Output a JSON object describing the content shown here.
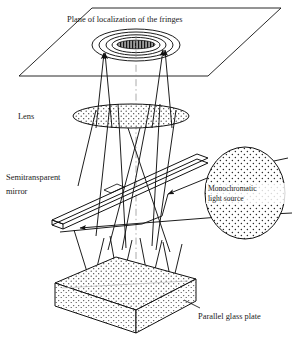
{
  "figure": {
    "type": "optical-ray-diagram",
    "background_color": "#ffffff",
    "line_color": "#111111",
    "text_color": "#1a1a1a"
  },
  "labels": {
    "fringe_plane": "Plane of localization of the fringes",
    "lens": "Lens",
    "mirror_line1": "Semitransparent",
    "mirror_line2": "mirror",
    "source_line1": "Monochromatic",
    "source_line2": "light source",
    "glass_plate": "Parallel glass plate"
  },
  "components": {
    "fringe_plane": {
      "name": "Plane of localization of the fringes",
      "shape": "parallelogram",
      "points": "92,8 281,8 208,76 19,76"
    },
    "fringe_pattern": {
      "name": "concentric interference fringes",
      "center_x": 136,
      "center_y": 45,
      "rings": [
        {
          "rx": 44,
          "ry": 16
        },
        {
          "rx": 37,
          "ry": 13
        },
        {
          "rx": 30,
          "ry": 10
        },
        {
          "rx": 24,
          "ry": 7.5
        }
      ],
      "core": {
        "rx": 19,
        "ry": 4.2,
        "fill": "striped"
      }
    },
    "lens": {
      "name": "Lens",
      "shape": "ellipse",
      "cx": 131,
      "cy": 116,
      "rx": 58,
      "ry": 12,
      "fill": "stipple"
    },
    "semitransparent_mirror": {
      "name": "Semitransparent mirror",
      "shape": "tilted-slab",
      "top_face": "52,220 197,154 208,158 63,224",
      "thickness": 5
    },
    "monochromatic_source": {
      "name": "Monochromatic light source",
      "shape": "ellipse",
      "cx": 245,
      "cy": 193,
      "rx": 40,
      "ry": 46,
      "fill": "stipple"
    },
    "glass_plate": {
      "name": "Parallel glass plate",
      "shape": "slab-3d",
      "top_face": "55,283 116,257 196,279 136,310",
      "thickness": 24,
      "fill": "stipple"
    }
  },
  "rays": {
    "description": "Light travels from the monochromatic source to the semitransparent mirror, reflects down to the parallel glass plate, returns through the mirror and lens, and converges onto the plane of localization of the fringes.",
    "arrow_count": 4,
    "upward_ray_pairs": 2
  },
  "axis": {
    "optical_axis": "vertical dash-dot centerline at x=136"
  }
}
